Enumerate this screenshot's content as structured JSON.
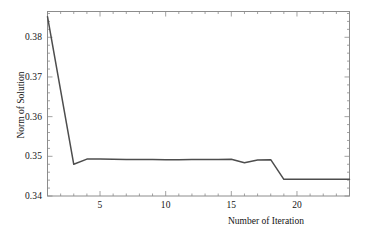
{
  "chart_data": {
    "type": "line",
    "title": "",
    "xlabel": "Number of Iteration",
    "ylabel": "Norm of Solution",
    "xlim": [
      1,
      24
    ],
    "ylim": [
      0.34,
      0.3865
    ],
    "grid": false,
    "legend": null,
    "line_color": "#4d4d4d",
    "background_color": "#ffffff",
    "frame_color": "#8c8c8c",
    "xticks": [
      5,
      10,
      15,
      20
    ],
    "xtick_labels": [
      "5",
      "10",
      "15",
      "20"
    ],
    "yticks": [
      0.34,
      0.35,
      0.36,
      0.37,
      0.38
    ],
    "ytick_labels": [
      "0.34",
      "0.35",
      "0.36",
      "0.37",
      "0.38"
    ],
    "x": [
      1,
      2,
      3,
      4,
      5,
      6,
      7,
      8,
      9,
      10,
      11,
      12,
      13,
      14,
      15,
      16,
      17,
      18,
      19,
      20,
      21,
      22,
      23,
      24
    ],
    "values": [
      0.3852,
      0.3666,
      0.348,
      0.3493,
      0.3493,
      0.34925,
      0.34922,
      0.3492,
      0.34918,
      0.34916,
      0.34916,
      0.34918,
      0.3492,
      0.34922,
      0.34925,
      0.3484,
      0.34905,
      0.34915,
      0.3442,
      0.3442,
      0.3442,
      0.3442,
      0.3442,
      0.3442
    ],
    "series": [
      {
        "name": "Norm of Solution",
        "values": [
          0.3852,
          0.3666,
          0.348,
          0.3493,
          0.3493,
          0.34925,
          0.34922,
          0.3492,
          0.34918,
          0.34916,
          0.34916,
          0.34918,
          0.3492,
          0.34922,
          0.34925,
          0.3484,
          0.34905,
          0.34915,
          0.3442,
          0.3442,
          0.3442,
          0.3442,
          0.3442,
          0.3442
        ]
      }
    ],
    "annotations": []
  },
  "axes": {
    "x_title": "Number of Iteration",
    "y_title": "Norm of Solution",
    "x_tick_labels": [
      "5",
      "10",
      "15",
      "20"
    ],
    "y_tick_labels": [
      "0.34",
      "0.35",
      "0.36",
      "0.37",
      "0.38"
    ]
  }
}
